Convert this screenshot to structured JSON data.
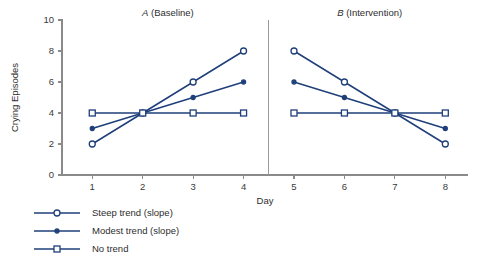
{
  "chart_data": {
    "type": "line",
    "title": "",
    "xlabel": "Day",
    "ylabel": "Crying Episodes",
    "xlim": [
      0.4,
      8.45
    ],
    "ylim": [
      0,
      10
    ],
    "xticks": [
      1,
      2,
      3,
      4,
      5,
      6,
      7,
      8
    ],
    "yticks": [
      0,
      2,
      4,
      6,
      8,
      10
    ],
    "grid": false,
    "legend_position": "below-left",
    "accent_color": "#1f3f7a",
    "axis_color": "#8a8a8a",
    "panels": [
      {
        "id": "panel-a",
        "label_italic": "A",
        "label_rest": " (Baseline)",
        "title": "A (Baseline)",
        "x": [
          1,
          2,
          3,
          4
        ]
      },
      {
        "id": "panel-b",
        "label_italic": "B",
        "label_rest": " (Intervention)",
        "title": "B (Intervention)",
        "x": [
          5,
          6,
          7,
          8
        ]
      }
    ],
    "phase_divider_x": 4.5,
    "series": [
      {
        "name": "Steep trend (slope)",
        "marker": "open-circle",
        "color": "#1f3f7a",
        "x": [
          1,
          2,
          3,
          4,
          5,
          6,
          7,
          8
        ],
        "values": [
          2,
          4,
          6,
          8,
          8,
          6,
          4,
          2
        ],
        "panel_a_values": [
          2,
          4,
          6,
          8
        ],
        "panel_b_values": [
          8,
          6,
          4,
          2
        ]
      },
      {
        "name": "Modest trend (slope)",
        "marker": "filled-circle",
        "color": "#1f3f7a",
        "x": [
          1,
          2,
          3,
          4,
          5,
          6,
          7,
          8
        ],
        "values": [
          3,
          4,
          5,
          6,
          6,
          5,
          4,
          3
        ],
        "panel_a_values": [
          3,
          4,
          5,
          6
        ],
        "panel_b_values": [
          6,
          5,
          4,
          3
        ]
      },
      {
        "name": "No trend",
        "marker": "open-square",
        "color": "#1f3f7a",
        "x": [
          1,
          2,
          3,
          4,
          5,
          6,
          7,
          8
        ],
        "values": [
          4,
          4,
          4,
          4,
          4,
          4,
          4,
          4
        ],
        "panel_a_values": [
          4,
          4,
          4,
          4
        ],
        "panel_b_values": [
          4,
          4,
          4,
          4
        ]
      }
    ]
  },
  "legend": {
    "items": [
      {
        "label": "Steep trend (slope)",
        "marker": "open-circle"
      },
      {
        "label": "Modest trend (slope)",
        "marker": "filled-circle"
      },
      {
        "label": "No trend",
        "marker": "open-square"
      }
    ]
  }
}
